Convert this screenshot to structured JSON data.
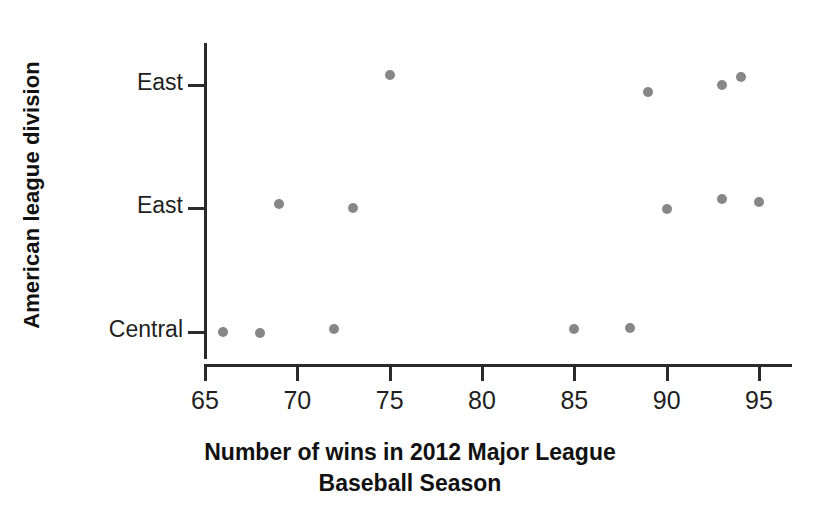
{
  "chart_data": {
    "type": "scatter",
    "title": "",
    "xlabel_lines": [
      "Number of wins in 2012 Major League",
      "Baseball Season"
    ],
    "xlabel": "Number of wins in 2012 Major League Baseball Season",
    "ylabel": "American league division",
    "x_ticks": [
      65,
      70,
      75,
      80,
      85,
      90,
      95
    ],
    "x_tick_labels": [
      "65",
      "70",
      "75",
      "80",
      "85",
      "90",
      "95"
    ],
    "xlim": [
      65,
      96.5
    ],
    "y_categories": [
      "Central",
      "East",
      "East"
    ],
    "y_tick_labels_top_to_bottom": [
      "East",
      "East",
      "Central"
    ],
    "grid": false,
    "legend": null,
    "marker_color": "#878787",
    "axis_color": "#2b2b2b",
    "points": [
      {
        "x": 75,
        "category": "East",
        "row": 2
      },
      {
        "x": 89,
        "category": "East",
        "row": 2
      },
      {
        "x": 93,
        "category": "East",
        "row": 2
      },
      {
        "x": 94,
        "category": "East",
        "row": 2
      },
      {
        "x": 69,
        "category": "East",
        "row": 1
      },
      {
        "x": 73,
        "category": "East",
        "row": 1
      },
      {
        "x": 90,
        "category": "East",
        "row": 1
      },
      {
        "x": 93,
        "category": "East",
        "row": 1
      },
      {
        "x": 95,
        "category": "East",
        "row": 1
      },
      {
        "x": 66,
        "category": "Central",
        "row": 0
      },
      {
        "x": 68,
        "category": "Central",
        "row": 0
      },
      {
        "x": 72,
        "category": "Central",
        "row": 0
      },
      {
        "x": 85,
        "category": "Central",
        "row": 0
      },
      {
        "x": 88,
        "category": "Central",
        "row": 0
      }
    ],
    "series": [
      {
        "name": "East (top)",
        "values": [
          75,
          89,
          93,
          94
        ]
      },
      {
        "name": "East (middle)",
        "values": [
          69,
          73,
          90,
          93,
          95
        ]
      },
      {
        "name": "Central (bottom)",
        "values": [
          66,
          68,
          72,
          85,
          88
        ]
      }
    ]
  },
  "layout": {
    "plot_left_px": 205,
    "plot_right_px": 759,
    "x_value_min": 65,
    "x_value_max": 95,
    "row_y_px": [
      332,
      208,
      85
    ],
    "point_jitter_y_px": [
      [
        0,
        1,
        -3,
        -3,
        -4
      ],
      [
        -4,
        0,
        1,
        -9,
        -6
      ],
      [
        -10,
        7,
        0,
        -8,
        0
      ]
    ]
  }
}
